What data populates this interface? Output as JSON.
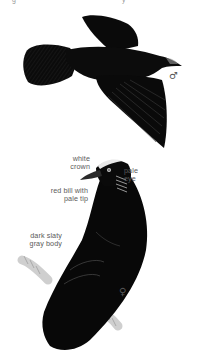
{
  "plate": {
    "subject": "two dark crow-like birds, one in flight and one perched",
    "background": "#ffffff",
    "bird_color": "#0a0a0a",
    "label_color": "#5a5a5a"
  },
  "top_cutoff": {
    "left_fragment": "g",
    "right_fragment": "y"
  },
  "flying_bird": {
    "sex_symbol": "♂"
  },
  "perched_bird": {
    "sex_symbol": "♀",
    "labels": {
      "crown": "white\ncrown",
      "eye": "pale\neye",
      "bill": "red bill with\npale tip",
      "body": "dark slaty\ngray body"
    }
  }
}
